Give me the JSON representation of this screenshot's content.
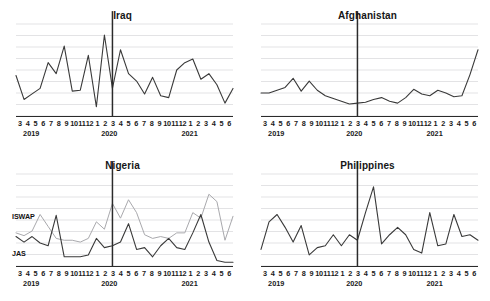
{
  "figure": {
    "panel_order": [
      "iraq",
      "afghanistan",
      "nigeria",
      "philippines"
    ],
    "marker_label": "2020-03",
    "grid_color": "#e3e3e5",
    "axis_color": "#2b2b2b",
    "marker_color": "#2b2b2b",
    "line_dark_color": "#3a3a3a",
    "line_light_color": "#a9a9ad"
  },
  "axis": {
    "month_ticks": [
      "3",
      "4",
      "5",
      "6",
      "7",
      "8",
      "9",
      "10",
      "11",
      "12",
      "1",
      "2",
      "3",
      "4",
      "5",
      "6",
      "7",
      "8",
      "9",
      "10",
      "11",
      "12",
      "1",
      "2",
      "3",
      "4",
      "5",
      "6"
    ],
    "year_labels": [
      {
        "text": "2019",
        "position_pct": 7
      },
      {
        "text": "2020",
        "position_pct": 43
      },
      {
        "text": "2021",
        "position_pct": 80
      }
    ]
  },
  "panels": {
    "iraq": {
      "title": "Iraq"
    },
    "afghanistan": {
      "title": "Afghanistan"
    },
    "nigeria": {
      "title": "Nigeria",
      "series_labels": {
        "iswap": "ISWAP",
        "jas": "JAS"
      }
    },
    "philippines": {
      "title": "Philippines"
    }
  },
  "chart_data": [
    {
      "type": "line",
      "title": "Iraq",
      "xlabel": "",
      "ylabel": "",
      "grid": true,
      "legend": "none",
      "gridlines": 8,
      "marker_line_x": "2020-03",
      "x": [
        "2019-03",
        "2019-04",
        "2019-05",
        "2019-06",
        "2019-07",
        "2019-08",
        "2019-09",
        "2019-10",
        "2019-11",
        "2019-12",
        "2020-01",
        "2020-02",
        "2020-03",
        "2020-04",
        "2020-05",
        "2020-06",
        "2020-07",
        "2020-08",
        "2020-09",
        "2020-10",
        "2020-11",
        "2020-12",
        "2021-01",
        "2021-02",
        "2021-03",
        "2021-04",
        "2021-05",
        "2021-06"
      ],
      "tick_labels": [
        "3",
        "4",
        "5",
        "6",
        "7",
        "8",
        "9",
        "10",
        "11",
        "12",
        "1",
        "2",
        "3",
        "4",
        "5",
        "6",
        "7",
        "8",
        "9",
        "10",
        "11",
        "12",
        "1",
        "2",
        "3",
        "4",
        "5",
        "6"
      ],
      "ylim": [
        0,
        100
      ],
      "values": [
        44,
        18,
        24,
        30,
        58,
        46,
        76,
        27,
        28,
        66,
        10,
        88,
        30,
        72,
        46,
        38,
        24,
        42,
        22,
        20,
        50,
        58,
        62,
        40,
        46,
        34,
        14,
        30
      ]
    },
    {
      "type": "line",
      "title": "Afghanistan",
      "xlabel": "",
      "ylabel": "",
      "grid": true,
      "legend": "none",
      "gridlines": 8,
      "marker_line_x": "2020-03",
      "x": [
        "2019-03",
        "2019-04",
        "2019-05",
        "2019-06",
        "2019-07",
        "2019-08",
        "2019-09",
        "2019-10",
        "2019-11",
        "2019-12",
        "2020-01",
        "2020-02",
        "2020-03",
        "2020-04",
        "2020-05",
        "2020-06",
        "2020-07",
        "2020-08",
        "2020-09",
        "2020-10",
        "2020-11",
        "2020-12",
        "2021-01",
        "2021-02",
        "2021-03",
        "2021-04",
        "2021-05",
        "2021-06"
      ],
      "tick_labels": [
        "3",
        "4",
        "5",
        "6",
        "7",
        "8",
        "9",
        "10",
        "11",
        "12",
        "1",
        "2",
        "3",
        "4",
        "5",
        "6",
        "7",
        "8",
        "9",
        "10",
        "11",
        "12",
        "1",
        "2",
        "3",
        "4",
        "5",
        "6"
      ],
      "ylim": [
        0,
        100
      ],
      "values": [
        25,
        25,
        28,
        31,
        41,
        27,
        38,
        28,
        22,
        19,
        16,
        13,
        14,
        15,
        18,
        20,
        16,
        14,
        20,
        29,
        24,
        22,
        28,
        25,
        21,
        22,
        45,
        72
      ]
    },
    {
      "type": "line",
      "title": "Nigeria",
      "xlabel": "",
      "ylabel": "",
      "grid": true,
      "legend": "inline-labels",
      "gridlines": 8,
      "marker_line_x": "2020-03",
      "x": [
        "2019-03",
        "2019-04",
        "2019-05",
        "2019-06",
        "2019-07",
        "2019-08",
        "2019-09",
        "2019-10",
        "2019-11",
        "2019-12",
        "2020-01",
        "2020-02",
        "2020-03",
        "2020-04",
        "2020-05",
        "2020-06",
        "2020-07",
        "2020-08",
        "2020-09",
        "2020-10",
        "2020-11",
        "2020-12",
        "2021-01",
        "2021-02",
        "2021-03",
        "2021-04",
        "2021-05",
        "2021-06"
      ],
      "tick_labels": [
        "3",
        "4",
        "5",
        "6",
        "7",
        "8",
        "9",
        "10",
        "11",
        "12",
        "1",
        "2",
        "3",
        "4",
        "5",
        "6",
        "7",
        "8",
        "9",
        "10",
        "11",
        "12",
        "1",
        "2",
        "3",
        "4",
        "5",
        "6"
      ],
      "ylim": [
        0,
        100
      ],
      "series": [
        {
          "name": "ISWAP",
          "color": "#a9a9ad",
          "values": [
            36,
            33,
            38,
            56,
            43,
            30,
            28,
            28,
            26,
            30,
            48,
            40,
            68,
            52,
            72,
            58,
            34,
            30,
            32,
            30,
            36,
            36,
            58,
            52,
            78,
            70,
            28,
            54
          ]
        },
        {
          "name": "JAS",
          "color": "#3a3a3a",
          "values": [
            32,
            26,
            32,
            25,
            22,
            55,
            10,
            10,
            10,
            12,
            30,
            20,
            22,
            26,
            46,
            18,
            20,
            10,
            22,
            30,
            20,
            18,
            36,
            56,
            26,
            6,
            4,
            4
          ]
        }
      ]
    },
    {
      "type": "line",
      "title": "Philippines",
      "xlabel": "",
      "ylabel": "",
      "grid": true,
      "legend": "none",
      "gridlines": 8,
      "marker_line_x": "2020-03",
      "x": [
        "2019-03",
        "2019-04",
        "2019-05",
        "2019-06",
        "2019-07",
        "2019-08",
        "2019-09",
        "2019-10",
        "2019-11",
        "2019-12",
        "2020-01",
        "2020-02",
        "2020-03",
        "2020-04",
        "2020-05",
        "2020-06",
        "2020-07",
        "2020-08",
        "2020-09",
        "2020-10",
        "2020-11",
        "2020-12",
        "2021-01",
        "2021-02",
        "2021-03",
        "2021-04",
        "2021-05",
        "2021-06"
      ],
      "tick_labels": [
        "3",
        "4",
        "5",
        "6",
        "7",
        "8",
        "9",
        "10",
        "11",
        "12",
        "1",
        "2",
        "3",
        "4",
        "5",
        "6",
        "7",
        "8",
        "9",
        "10",
        "11",
        "12",
        "1",
        "2",
        "3",
        "4",
        "5",
        "6"
      ],
      "ylim": [
        0,
        100
      ],
      "values": [
        18,
        48,
        56,
        42,
        26,
        44,
        12,
        20,
        22,
        34,
        22,
        34,
        28,
        58,
        86,
        24,
        34,
        42,
        34,
        18,
        14,
        58,
        22,
        24,
        56,
        32,
        34,
        28
      ]
    }
  ]
}
